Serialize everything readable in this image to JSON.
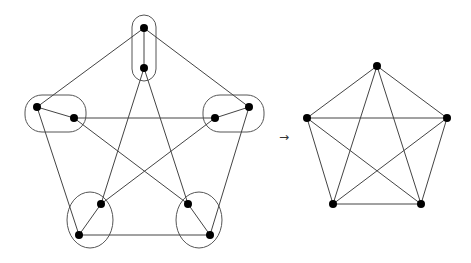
{
  "figure": {
    "arrow_label": "→",
    "left_graph": {
      "description": "Graph with 10 vertices grouped into 5 contracted sets",
      "nodes": [
        {
          "id": "t1",
          "x": 144,
          "y": 28
        },
        {
          "id": "t2",
          "x": 144,
          "y": 68
        },
        {
          "id": "l1",
          "x": 37,
          "y": 107
        },
        {
          "id": "l2",
          "x": 74,
          "y": 118
        },
        {
          "id": "r1",
          "x": 249,
          "y": 107
        },
        {
          "id": "r2",
          "x": 215,
          "y": 118
        },
        {
          "id": "bl1",
          "x": 79,
          "y": 235
        },
        {
          "id": "bl2",
          "x": 101,
          "y": 204
        },
        {
          "id": "br1",
          "x": 210,
          "y": 235
        },
        {
          "id": "br2",
          "x": 188,
          "y": 204
        }
      ],
      "edges": [
        [
          "t1",
          "t2"
        ],
        [
          "l1",
          "l2"
        ],
        [
          "r1",
          "r2"
        ],
        [
          "bl1",
          "bl2"
        ],
        [
          "br1",
          "br2"
        ],
        [
          "t1",
          "l1"
        ],
        [
          "t1",
          "r1"
        ],
        [
          "l1",
          "bl1"
        ],
        [
          "r1",
          "br1"
        ],
        [
          "bl1",
          "br1"
        ],
        [
          "l2",
          "r2"
        ],
        [
          "t2",
          "bl2"
        ],
        [
          "t2",
          "br2"
        ],
        [
          "l2",
          "br2"
        ],
        [
          "r2",
          "bl2"
        ]
      ],
      "groups": [
        {
          "shape": "rect",
          "x": 132,
          "y": 15,
          "w": 24,
          "h": 66,
          "r": 12
        },
        {
          "shape": "rect",
          "x": 25,
          "y": 95,
          "w": 61,
          "h": 37,
          "r": 17
        },
        {
          "shape": "rect",
          "x": 203,
          "y": 95,
          "w": 61,
          "h": 37,
          "r": 17
        },
        {
          "shape": "ellipse",
          "cx": 90,
          "cy": 220,
          "rx": 23,
          "ry": 28
        },
        {
          "shape": "ellipse",
          "cx": 199,
          "cy": 220,
          "rx": 23,
          "ry": 28
        }
      ]
    },
    "right_graph": {
      "description": "Complete graph K5",
      "nodes": [
        {
          "id": "a",
          "x": 377,
          "y": 66
        },
        {
          "id": "b",
          "x": 307,
          "y": 118
        },
        {
          "id": "c",
          "x": 447,
          "y": 118
        },
        {
          "id": "d",
          "x": 333,
          "y": 204
        },
        {
          "id": "e",
          "x": 421,
          "y": 204
        }
      ],
      "edges": [
        [
          "a",
          "b"
        ],
        [
          "a",
          "c"
        ],
        [
          "a",
          "d"
        ],
        [
          "a",
          "e"
        ],
        [
          "b",
          "c"
        ],
        [
          "b",
          "d"
        ],
        [
          "b",
          "e"
        ],
        [
          "c",
          "d"
        ],
        [
          "c",
          "e"
        ],
        [
          "d",
          "e"
        ]
      ]
    }
  }
}
